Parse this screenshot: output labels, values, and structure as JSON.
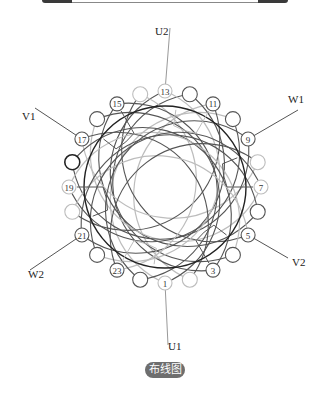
{
  "diagram": {
    "caption": "布线图",
    "center": {
      "x": 165,
      "y": 187
    },
    "rotor_radius": 81,
    "slot_ring_radius": 96,
    "slot_radius": 6,
    "slot_count": 24,
    "labeled_slots": [
      "1",
      "3",
      "5",
      "7",
      "9",
      "11",
      "13",
      "15",
      "17",
      "19",
      "21",
      "23"
    ],
    "terminals": [
      {
        "id": "U1",
        "label": "U1",
        "x": 168,
        "y": 350
      },
      {
        "id": "U2",
        "label": "U2",
        "x": 155,
        "y": 35
      },
      {
        "id": "V1",
        "label": "V1",
        "x": 22,
        "y": 120
      },
      {
        "id": "V2",
        "label": "V2",
        "x": 292,
        "y": 266
      },
      {
        "id": "W1",
        "label": "W1",
        "x": 288,
        "y": 103
      },
      {
        "id": "W2",
        "label": "W2",
        "x": 28,
        "y": 278
      }
    ],
    "colors": {
      "dark_coil": "#555555",
      "light_coil": "#bdbdbd",
      "rotor": "#222222",
      "caption_bg": "#6e6e6e"
    }
  }
}
